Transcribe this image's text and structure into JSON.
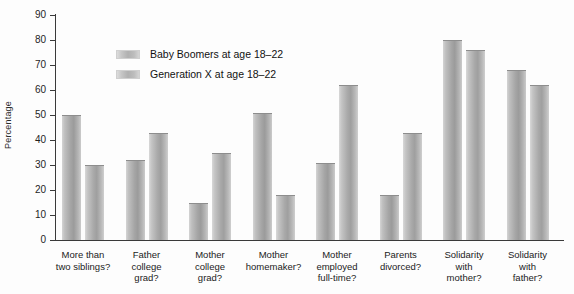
{
  "chart_data": {
    "type": "bar",
    "title": "",
    "xlabel": "",
    "ylabel": "Percentage",
    "ylim": [
      0,
      90
    ],
    "ytick_step": 10,
    "yticks": [
      "0",
      "10",
      "20",
      "30",
      "40",
      "50",
      "60",
      "70",
      "80",
      "90"
    ],
    "grid": false,
    "legend_position": "inside-top-left",
    "categories": [
      "More than\ntwo siblings?",
      "Father\ncollege\ngrad?",
      "Mother\ncollege\ngrad?",
      "Mother\nhomemaker?",
      "Mother\nemployed\nfull-time?",
      "Parents\ndivorced?",
      "Solidarity\nwith\nmother?",
      "Solidarity\nwith\nfather?"
    ],
    "series": [
      {
        "name": "Baby Boomers at age 18–22",
        "color": "#a8a8a8",
        "values": [
          50,
          32,
          15,
          51,
          31,
          18,
          80,
          68
        ]
      },
      {
        "name": "Generation X at age 18–22",
        "color": "#a8a8a8",
        "values": [
          30,
          43,
          35,
          18,
          62,
          43,
          76,
          62
        ]
      }
    ]
  },
  "legend": {
    "items": [
      {
        "label": "Baby Boomers at age 18–22"
      },
      {
        "label": "Generation X at age 18–22"
      }
    ]
  }
}
